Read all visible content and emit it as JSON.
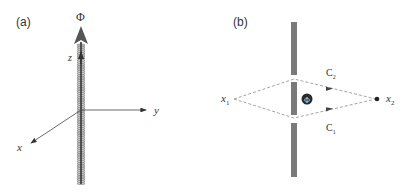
{
  "panel_a": {
    "label": "(a)",
    "flux_symbol": "Φ",
    "axes": {
      "x": "x",
      "y": "y",
      "z": "z"
    }
  },
  "panel_b": {
    "label": "(b)",
    "flux_symbol": "Φ",
    "start_point": {
      "base": "x",
      "sub": "1"
    },
    "end_point": {
      "base": "x",
      "sub": "2"
    },
    "paths": [
      {
        "name": "C",
        "sub": "2"
      },
      {
        "name": "C",
        "sub": "1"
      }
    ]
  },
  "colors": {
    "bar": "#7a7a7a",
    "dashed": "#9a9a9a",
    "axis": "#444444",
    "arrow": "#555555",
    "flux_circle": "#2a2a2a"
  }
}
